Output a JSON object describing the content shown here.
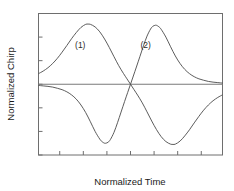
{
  "chart_data": {
    "type": "line",
    "title": "",
    "xlabel": "Normalized Time",
    "ylabel": "Normalized Chirp",
    "xlim": [
      -3.9,
      3.9
    ],
    "ylim": [
      -3,
      3
    ],
    "xticks": [
      -3,
      -2,
      -1,
      0,
      1,
      2,
      3
    ],
    "xtick_labels": [
      "-3",
      "-2",
      "-1",
      "0",
      "1",
      "2",
      "3"
    ],
    "yticks": [
      3,
      2,
      1,
      0,
      -1,
      -2,
      -3
    ],
    "ytick_labels": [
      "3",
      "2",
      "1",
      "0",
      "-1",
      "-2",
      "-3"
    ],
    "grid": false,
    "legend": "none",
    "annotations": [
      {
        "text": "(1)",
        "x": -2.35,
        "y": 1.55
      },
      {
        "text": "(2)",
        "x": 0.42,
        "y": 1.55
      }
    ],
    "series": [
      {
        "name": "(1)",
        "color": "#4a4a4a",
        "x": [
          -3.9,
          -3.7,
          -3.5,
          -3.3,
          -3.1,
          -2.9,
          -2.7,
          -2.5,
          -2.3,
          -2.1,
          -1.9,
          -1.8,
          -1.7,
          -1.5,
          -1.3,
          -1.1,
          -0.9,
          -0.7,
          -0.5,
          -0.3,
          -0.15,
          0.0,
          0.15,
          0.3,
          0.5,
          0.7,
          0.9,
          1.1,
          1.3,
          1.5,
          1.7,
          1.8,
          1.9,
          2.1,
          2.3,
          2.5,
          2.7,
          2.9,
          3.1,
          3.3,
          3.5,
          3.7,
          3.9
        ],
        "y": [
          0.45,
          0.56,
          0.7,
          0.88,
          1.1,
          1.36,
          1.64,
          1.93,
          2.19,
          2.41,
          2.54,
          2.55,
          2.54,
          2.43,
          2.22,
          1.92,
          1.56,
          1.17,
          0.79,
          0.46,
          0.23,
          0.0,
          -0.23,
          -0.46,
          -0.79,
          -1.17,
          -1.56,
          -1.92,
          -2.22,
          -2.43,
          -2.54,
          -2.55,
          -2.54,
          -2.41,
          -2.19,
          -1.93,
          -1.64,
          -1.36,
          -1.1,
          -0.88,
          -0.7,
          -0.56,
          -0.45
        ]
      },
      {
        "name": "(2)",
        "color": "#4a4a4a",
        "x": [
          -3.9,
          -3.7,
          -3.5,
          -3.3,
          -3.1,
          -2.9,
          -2.7,
          -2.5,
          -2.3,
          -2.1,
          -1.9,
          -1.7,
          -1.5,
          -1.3,
          -1.2,
          -1.1,
          -1.05,
          -0.95,
          -0.85,
          -0.7,
          -0.55,
          -0.4,
          -0.25,
          -0.12,
          0.0,
          0.12,
          0.25,
          0.4,
          0.55,
          0.7,
          0.85,
          0.95,
          1.05,
          1.1,
          1.2,
          1.3,
          1.5,
          1.7,
          1.9,
          2.1,
          2.3,
          2.5,
          2.7,
          2.9,
          3.1,
          3.3,
          3.5,
          3.7,
          3.9
        ],
        "y": [
          -0.05,
          -0.07,
          -0.09,
          -0.12,
          -0.17,
          -0.23,
          -0.32,
          -0.45,
          -0.63,
          -0.88,
          -1.2,
          -1.59,
          -2.0,
          -2.33,
          -2.44,
          -2.5,
          -2.5,
          -2.46,
          -2.34,
          -2.04,
          -1.63,
          -1.18,
          -0.73,
          -0.35,
          0.0,
          0.35,
          0.73,
          1.18,
          1.63,
          2.04,
          2.34,
          2.46,
          2.5,
          2.5,
          2.44,
          2.33,
          2.0,
          1.59,
          1.2,
          0.88,
          0.63,
          0.45,
          0.32,
          0.23,
          0.17,
          0.12,
          0.09,
          0.07,
          0.05
        ]
      }
    ],
    "zero_reference_line": 0
  }
}
